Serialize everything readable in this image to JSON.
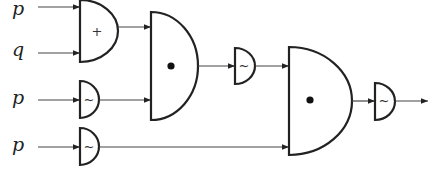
{
  "diagram": {
    "type": "logic-circuit",
    "colors": {
      "line": "#222222",
      "wire": "#444444",
      "background": "#ffffff"
    },
    "inputs": [
      {
        "id": "in1",
        "label": "p"
      },
      {
        "id": "in2",
        "label": "q"
      },
      {
        "id": "in3",
        "label": "p"
      },
      {
        "id": "in4",
        "label": "p"
      }
    ],
    "gates": [
      {
        "id": "or1",
        "kind": "OR",
        "symbol": "+",
        "inputs": [
          "in1",
          "in2"
        ]
      },
      {
        "id": "not1",
        "kind": "NOT",
        "symbol": "~",
        "inputs": [
          "in3"
        ]
      },
      {
        "id": "not2",
        "kind": "NOT",
        "symbol": "~",
        "inputs": [
          "in4"
        ]
      },
      {
        "id": "and1",
        "kind": "AND",
        "symbol": "•",
        "inputs": [
          "or1",
          "not1"
        ]
      },
      {
        "id": "not3",
        "kind": "NOT",
        "symbol": "~",
        "inputs": [
          "and1"
        ]
      },
      {
        "id": "and2",
        "kind": "AND",
        "symbol": "•",
        "inputs": [
          "not3",
          "not2"
        ]
      },
      {
        "id": "not4",
        "kind": "NOT",
        "symbol": "~",
        "inputs": [
          "and2"
        ]
      }
    ],
    "output": {
      "from": "not4",
      "label": ""
    }
  }
}
